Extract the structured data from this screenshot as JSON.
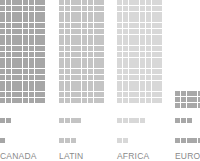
{
  "chart_data": {
    "type": "waffle",
    "title": "",
    "categories": [
      "CANADA",
      "LATIN",
      "AFRICA",
      "EUROP"
    ],
    "units_per_row": 8,
    "series": [
      {
        "name": "row_1_main",
        "values": [
          144,
          144,
          144,
          24
        ]
      },
      {
        "name": "row_2",
        "values": [
          2,
          4,
          5,
          3
        ]
      },
      {
        "name": "row_3",
        "values": [
          1,
          3,
          2,
          7
        ]
      }
    ],
    "colors": {
      "CANADA": "#a6a6a6",
      "LATIN": "#c4c4c4",
      "AFRICA": "#d8d8d8",
      "EUROP": "#a8a8a8"
    },
    "grid": false,
    "legend": "none"
  },
  "columns": [
    {
      "label": "CANADA",
      "color": "#a6a6a6",
      "x": 0,
      "main": {
        "top": 0,
        "count": 144
      },
      "mid": {
        "top": 118,
        "count": 2
      },
      "low": {
        "top": 138,
        "count": 1
      }
    },
    {
      "label": "LATIN",
      "color": "#c4c4c4",
      "x": 59,
      "main": {
        "top": 0,
        "count": 144
      },
      "mid": {
        "top": 118,
        "count": 4
      },
      "low": {
        "top": 138,
        "count": 3
      }
    },
    {
      "label": "AFRICA",
      "color": "#d8d8d8",
      "x": 117,
      "main": {
        "top": 0,
        "count": 144
      },
      "mid": {
        "top": 118,
        "count": 5
      },
      "low": {
        "top": 138,
        "count": 2
      }
    },
    {
      "label": "EUROP",
      "color": "#a8a8a8",
      "x": 175,
      "main": {
        "top": 91,
        "count": 24
      },
      "mid": {
        "top": 118,
        "count": 3
      },
      "low": {
        "top": 138,
        "count": 7
      }
    }
  ]
}
